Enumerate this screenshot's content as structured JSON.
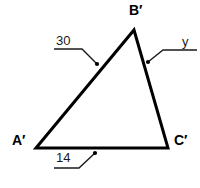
{
  "figure": {
    "background_color": "#ffffff",
    "stroke_color": "#000000",
    "leader_color": "#1a1a1a"
  },
  "vertices": [
    {
      "id": "B",
      "label": "B′",
      "x": 134,
      "y": 30
    },
    {
      "id": "A",
      "label": "A′",
      "x": 36,
      "y": 148
    },
    {
      "id": "C",
      "label": "C′",
      "x": 168,
      "y": 148
    }
  ],
  "measurements": [
    {
      "id": "side-AB",
      "label": "30",
      "side": "A'B'",
      "leader": {
        "x1": 54,
        "y1": 49,
        "x2": 82,
        "y2": 49,
        "x3": 97,
        "y3": 64
      },
      "dot": {
        "cx": 97,
        "cy": 64
      }
    },
    {
      "id": "side-BC",
      "label": "y",
      "side": "B'C'",
      "leader": {
        "x1": 197,
        "y1": 50,
        "x2": 163,
        "y2": 50,
        "x3": 148,
        "y3": 62
      },
      "dot": {
        "cx": 148,
        "cy": 62
      }
    },
    {
      "id": "side-AC",
      "label": "14",
      "side": "A'C'",
      "leader": {
        "x1": 54,
        "y1": 168,
        "x2": 79,
        "y2": 168,
        "x3": 95,
        "y3": 153
      },
      "dot": {
        "cx": 95,
        "cy": 153
      }
    }
  ],
  "shape": {
    "path": "M 36 148 L 134 30 L 168 148 Z",
    "stroke_width": 3
  }
}
